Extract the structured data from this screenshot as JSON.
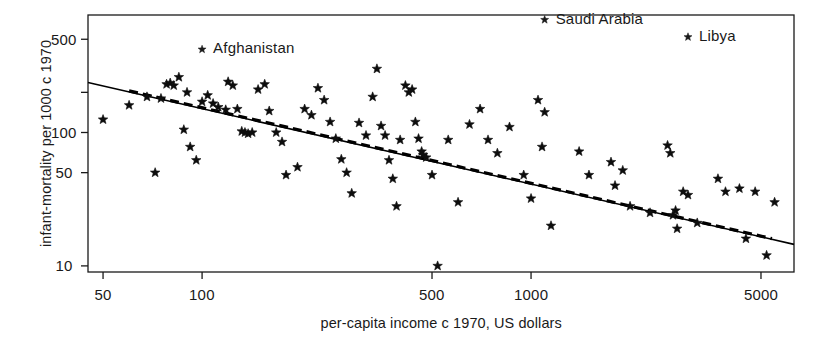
{
  "chart_data": {
    "type": "scatter",
    "title": "",
    "xlabel": "per-capita income c 1970, US dollars",
    "ylabel": "infant-mortality per 1000 c 1970",
    "xscale": "log",
    "yscale": "log",
    "xlim": [
      45,
      6300
    ],
    "ylim": [
      9,
      760
    ],
    "grid": false,
    "legend": "none",
    "marker": "star",
    "marker_color": "#000000",
    "xticks": [
      50,
      100,
      500,
      1000,
      5000
    ],
    "xtick_labels": [
      "50",
      "100",
      "500",
      "1000",
      "5000"
    ],
    "yticks": [
      10,
      50,
      100,
      500
    ],
    "ytick_labels": [
      "10",
      "50",
      "100",
      "500"
    ],
    "yticks_minor": [
      200
    ],
    "annotations": [
      {
        "text": "Afghanistan",
        "x": 100,
        "y": 420,
        "marker": true
      },
      {
        "text": "Saudi Arabia",
        "x": 1100,
        "y": 700,
        "marker": true
      },
      {
        "text": "Libya",
        "x": 3000,
        "y": 520,
        "marker": true
      }
    ],
    "lines": [
      {
        "name": "least-squares fit",
        "style": "solid",
        "color": "#000000",
        "x": [
          45,
          6300
        ],
        "y": [
          237,
          14.5
        ]
      },
      {
        "name": "robust fit",
        "style": "dashed",
        "color": "#000000",
        "x": [
          60,
          5400
        ],
        "y": [
          205,
          16.0
        ]
      }
    ],
    "points": [
      {
        "x": 50,
        "y": 125
      },
      {
        "x": 60,
        "y": 160
      },
      {
        "x": 68,
        "y": 185
      },
      {
        "x": 72,
        "y": 50
      },
      {
        "x": 75,
        "y": 180
      },
      {
        "x": 78,
        "y": 230
      },
      {
        "x": 80,
        "y": 235
      },
      {
        "x": 82,
        "y": 225
      },
      {
        "x": 85,
        "y": 260
      },
      {
        "x": 88,
        "y": 105
      },
      {
        "x": 90,
        "y": 200
      },
      {
        "x": 92,
        "y": 78
      },
      {
        "x": 96,
        "y": 62
      },
      {
        "x": 100,
        "y": 170
      },
      {
        "x": 104,
        "y": 190
      },
      {
        "x": 108,
        "y": 165
      },
      {
        "x": 112,
        "y": 155
      },
      {
        "x": 118,
        "y": 148
      },
      {
        "x": 120,
        "y": 240
      },
      {
        "x": 124,
        "y": 225
      },
      {
        "x": 128,
        "y": 150
      },
      {
        "x": 132,
        "y": 102
      },
      {
        "x": 135,
        "y": 100
      },
      {
        "x": 138,
        "y": 98
      },
      {
        "x": 142,
        "y": 100
      },
      {
        "x": 148,
        "y": 210
      },
      {
        "x": 155,
        "y": 230
      },
      {
        "x": 160,
        "y": 145
      },
      {
        "x": 168,
        "y": 100
      },
      {
        "x": 175,
        "y": 85
      },
      {
        "x": 180,
        "y": 48
      },
      {
        "x": 195,
        "y": 55
      },
      {
        "x": 205,
        "y": 150
      },
      {
        "x": 215,
        "y": 135
      },
      {
        "x": 225,
        "y": 215
      },
      {
        "x": 235,
        "y": 175
      },
      {
        "x": 245,
        "y": 120
      },
      {
        "x": 255,
        "y": 90
      },
      {
        "x": 265,
        "y": 63
      },
      {
        "x": 275,
        "y": 50
      },
      {
        "x": 285,
        "y": 35
      },
      {
        "x": 300,
        "y": 118
      },
      {
        "x": 315,
        "y": 95
      },
      {
        "x": 330,
        "y": 185
      },
      {
        "x": 340,
        "y": 300
      },
      {
        "x": 350,
        "y": 112
      },
      {
        "x": 360,
        "y": 95
      },
      {
        "x": 370,
        "y": 62
      },
      {
        "x": 380,
        "y": 45
      },
      {
        "x": 390,
        "y": 28
      },
      {
        "x": 400,
        "y": 88
      },
      {
        "x": 415,
        "y": 225
      },
      {
        "x": 425,
        "y": 200
      },
      {
        "x": 435,
        "y": 210
      },
      {
        "x": 445,
        "y": 120
      },
      {
        "x": 455,
        "y": 90
      },
      {
        "x": 465,
        "y": 72
      },
      {
        "x": 470,
        "y": 68
      },
      {
        "x": 480,
        "y": 65
      },
      {
        "x": 500,
        "y": 48
      },
      {
        "x": 520,
        "y": 10
      },
      {
        "x": 560,
        "y": 88
      },
      {
        "x": 600,
        "y": 30
      },
      {
        "x": 650,
        "y": 115
      },
      {
        "x": 700,
        "y": 150
      },
      {
        "x": 740,
        "y": 88
      },
      {
        "x": 790,
        "y": 70
      },
      {
        "x": 860,
        "y": 110
      },
      {
        "x": 950,
        "y": 48
      },
      {
        "x": 1000,
        "y": 32
      },
      {
        "x": 1050,
        "y": 175
      },
      {
        "x": 1080,
        "y": 78
      },
      {
        "x": 1100,
        "y": 142
      },
      {
        "x": 1150,
        "y": 20
      },
      {
        "x": 1400,
        "y": 72
      },
      {
        "x": 1500,
        "y": 48
      },
      {
        "x": 1750,
        "y": 60
      },
      {
        "x": 1800,
        "y": 40
      },
      {
        "x": 1900,
        "y": 52
      },
      {
        "x": 2000,
        "y": 28
      },
      {
        "x": 2300,
        "y": 25
      },
      {
        "x": 2600,
        "y": 80
      },
      {
        "x": 2650,
        "y": 70
      },
      {
        "x": 2700,
        "y": 24
      },
      {
        "x": 2750,
        "y": 26
      },
      {
        "x": 2780,
        "y": 19
      },
      {
        "x": 2900,
        "y": 36
      },
      {
        "x": 3000,
        "y": 34
      },
      {
        "x": 3200,
        "y": 21
      },
      {
        "x": 3700,
        "y": 45
      },
      {
        "x": 3900,
        "y": 36
      },
      {
        "x": 4300,
        "y": 38
      },
      {
        "x": 4500,
        "y": 16
      },
      {
        "x": 4800,
        "y": 36
      },
      {
        "x": 5200,
        "y": 12
      },
      {
        "x": 5500,
        "y": 30
      }
    ]
  }
}
